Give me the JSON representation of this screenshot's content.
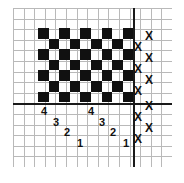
{
  "figure": {
    "title": "",
    "background_color": "#ffffff",
    "grid_color": "#b9b9b9",
    "axis_color": "#1a1a1a",
    "ink_color": "#111111"
  },
  "grid": {
    "columns": 15,
    "rows": 15,
    "cell_size": 10.6,
    "origin_x": 13,
    "origin_y": 8,
    "show": true
  },
  "axes": {
    "vertical": {
      "x": 133,
      "thickness": 2,
      "label": ""
    },
    "horizontal": {
      "y": 103,
      "thickness": 2,
      "label": ""
    }
  },
  "checkerboard": {
    "start_x": 38,
    "start_y": 28,
    "cols": 9,
    "rows": 7,
    "cell": 10.6,
    "first_cell_filled": true,
    "fill_color": "#111111",
    "pattern": [
      [
        1,
        0,
        1,
        0,
        1,
        0,
        1,
        0,
        1
      ],
      [
        0,
        1,
        0,
        1,
        0,
        1,
        0,
        1,
        0
      ],
      [
        1,
        0,
        1,
        0,
        1,
        0,
        1,
        0,
        1
      ],
      [
        0,
        1,
        0,
        1,
        0,
        1,
        0,
        1,
        0
      ],
      [
        1,
        0,
        1,
        0,
        1,
        0,
        1,
        0,
        1
      ],
      [
        0,
        1,
        0,
        1,
        0,
        1,
        0,
        1,
        0
      ],
      [
        1,
        0,
        1,
        0,
        1,
        0,
        1,
        0,
        1
      ]
    ]
  },
  "x_marks": {
    "glyph": "X",
    "font_size": 12,
    "items": [
      {
        "label": "X",
        "x": 145,
        "y": 30
      },
      {
        "label": "X",
        "x": 134,
        "y": 41
      },
      {
        "label": "X",
        "x": 145,
        "y": 52
      },
      {
        "label": "X",
        "x": 134,
        "y": 63
      },
      {
        "label": "X",
        "x": 145,
        "y": 74
      },
      {
        "label": "X",
        "x": 134,
        "y": 85
      },
      {
        "label": "X",
        "x": 145,
        "y": 100
      },
      {
        "label": "X",
        "x": 134,
        "y": 111
      },
      {
        "label": "X",
        "x": 145,
        "y": 122
      },
      {
        "label": "X",
        "x": 134,
        "y": 133
      }
    ]
  },
  "digit_labels": {
    "font_size": 11,
    "items": [
      {
        "label": "4",
        "x": 41,
        "y": 106
      },
      {
        "label": "3",
        "x": 53,
        "y": 117
      },
      {
        "label": "2",
        "x": 64,
        "y": 127
      },
      {
        "label": "1",
        "x": 77,
        "y": 138
      },
      {
        "label": "4",
        "x": 88,
        "y": 106
      },
      {
        "label": "3",
        "x": 99,
        "y": 117
      },
      {
        "label": "2",
        "x": 110,
        "y": 127
      },
      {
        "label": "1",
        "x": 123,
        "y": 138
      }
    ]
  }
}
